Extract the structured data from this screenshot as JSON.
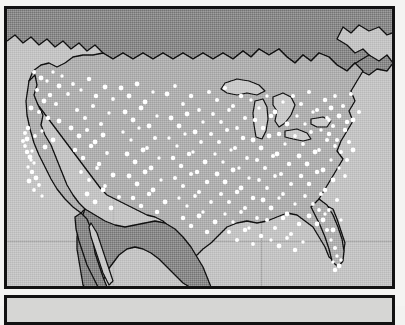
{
  "figure": {
    "title": "Dot density map of the contiguous United States",
    "background_color": "#f4f4f2",
    "border_color": "#121212",
    "panel_a_label": "map-panel",
    "panel_b_label": "secondary-panel"
  },
  "map": {
    "region": "Contiguous United States",
    "projection_note": "conic",
    "colors": {
      "ocean": "#c4c4c4",
      "united_states_land": "#b0b0b0",
      "foreign_land": "#8a8a8a",
      "lakes": "#c9c9c9",
      "dot": "#ffffff",
      "outline": "#101010",
      "graticule": "#9c9c9c"
    },
    "features": [
      {
        "name": "Canada",
        "type": "foreign-land",
        "shade": "dark-gray"
      },
      {
        "name": "Mexico",
        "type": "foreign-land",
        "shade": "dark-gray"
      },
      {
        "name": "United States",
        "type": "study-area",
        "shade": "medium-gray"
      },
      {
        "name": "Great Lakes",
        "type": "water",
        "shade": "light-gray"
      },
      {
        "name": "Pacific Ocean",
        "type": "water",
        "shade": "light-gray"
      },
      {
        "name": "Atlantic Ocean",
        "type": "water",
        "shade": "light-gray"
      },
      {
        "name": "Gulf of Mexico",
        "type": "water",
        "shade": "light-gray"
      },
      {
        "name": "Gulf of California",
        "type": "water",
        "shade": "light-gray"
      }
    ],
    "graticule": {
      "visible": true,
      "horizontal_lines": [
        238
      ],
      "vertical_lines": [
        258,
        110
      ]
    }
  },
  "chart_data": {
    "type": "scatter",
    "title": "Dot density map of the contiguous United States",
    "xlabel": "",
    "ylabel": "",
    "legend": [],
    "grid": true,
    "density_description": {
      "highest": "Northeast and Mid-Atlantic corridor",
      "high": "Great Lakes / Midwest industrial belt, Southeast Piedmont",
      "moderate": "Ohio Valley, Tennessee, Gulf Coast of Texas",
      "sparse": "Great Plains, Intermountain West",
      "coastal_clusters": "California coast, Puget Sound, Florida peninsula"
    },
    "points": [
      [
        40,
        78
      ],
      [
        46,
        81
      ],
      [
        52,
        72
      ],
      [
        58,
        86
      ],
      [
        49,
        95
      ],
      [
        36,
        90
      ],
      [
        43,
        101
      ],
      [
        55,
        104
      ],
      [
        33,
        72
      ],
      [
        61,
        76
      ],
      [
        67,
        94
      ],
      [
        38,
        112
      ],
      [
        47,
        118
      ],
      [
        30,
        108
      ],
      [
        58,
        121
      ],
      [
        27,
        128
      ],
      [
        34,
        136
      ],
      [
        41,
        131
      ],
      [
        52,
        140
      ],
      [
        44,
        147
      ],
      [
        31,
        151
      ],
      [
        26,
        139
      ],
      [
        24,
        146
      ],
      [
        29,
        157
      ],
      [
        33,
        163
      ],
      [
        27,
        167
      ],
      [
        31,
        172
      ],
      [
        35,
        178
      ],
      [
        28,
        181
      ],
      [
        38,
        185
      ],
      [
        33,
        190
      ],
      [
        41,
        196
      ],
      [
        24,
        133
      ],
      [
        22,
        141
      ],
      [
        26,
        152
      ],
      [
        30,
        160
      ],
      [
        72,
        84
      ],
      [
        80,
        90
      ],
      [
        88,
        79
      ],
      [
        95,
        96
      ],
      [
        104,
        87
      ],
      [
        112,
        99
      ],
      [
        76,
        110
      ],
      [
        84,
        118
      ],
      [
        92,
        106
      ],
      [
        100,
        124
      ],
      [
        108,
        113
      ],
      [
        70,
        128
      ],
      [
        78,
        136
      ],
      [
        86,
        130
      ],
      [
        94,
        142
      ],
      [
        102,
        135
      ],
      [
        74,
        150
      ],
      [
        82,
        158
      ],
      [
        90,
        146
      ],
      [
        98,
        164
      ],
      [
        106,
        153
      ],
      [
        80,
        172
      ],
      [
        88,
        180
      ],
      [
        96,
        168
      ],
      [
        104,
        186
      ],
      [
        112,
        175
      ],
      [
        86,
        194
      ],
      [
        94,
        202
      ],
      [
        102,
        190
      ],
      [
        110,
        208
      ],
      [
        118,
        197
      ],
      [
        120,
        88
      ],
      [
        128,
        96
      ],
      [
        136,
        84
      ],
      [
        144,
        102
      ],
      [
        152,
        92
      ],
      [
        124,
        112
      ],
      [
        132,
        120
      ],
      [
        140,
        108
      ],
      [
        148,
        126
      ],
      [
        156,
        116
      ],
      [
        122,
        132
      ],
      [
        130,
        140
      ],
      [
        138,
        128
      ],
      [
        146,
        148
      ],
      [
        154,
        138
      ],
      [
        126,
        154
      ],
      [
        134,
        162
      ],
      [
        142,
        150
      ],
      [
        150,
        168
      ],
      [
        158,
        158
      ],
      [
        128,
        176
      ],
      [
        136,
        184
      ],
      [
        144,
        172
      ],
      [
        152,
        190
      ],
      [
        160,
        180
      ],
      [
        132,
        198
      ],
      [
        140,
        206
      ],
      [
        148,
        194
      ],
      [
        156,
        212
      ],
      [
        164,
        202
      ],
      [
        166,
        94
      ],
      [
        174,
        86
      ],
      [
        182,
        104
      ],
      [
        190,
        96
      ],
      [
        198,
        110
      ],
      [
        170,
        118
      ],
      [
        178,
        126
      ],
      [
        186,
        114
      ],
      [
        194,
        132
      ],
      [
        202,
        122
      ],
      [
        168,
        138
      ],
      [
        176,
        146
      ],
      [
        184,
        134
      ],
      [
        192,
        152
      ],
      [
        200,
        142
      ],
      [
        172,
        158
      ],
      [
        180,
        166
      ],
      [
        188,
        154
      ],
      [
        196,
        172
      ],
      [
        204,
        162
      ],
      [
        174,
        178
      ],
      [
        182,
        186
      ],
      [
        190,
        174
      ],
      [
        198,
        192
      ],
      [
        206,
        182
      ],
      [
        178,
        198
      ],
      [
        186,
        206
      ],
      [
        194,
        196
      ],
      [
        202,
        212
      ],
      [
        210,
        202
      ],
      [
        182,
        218
      ],
      [
        190,
        226
      ],
      [
        198,
        216
      ],
      [
        206,
        232
      ],
      [
        214,
        222
      ],
      [
        208,
        92
      ],
      [
        216,
        100
      ],
      [
        224,
        88
      ],
      [
        232,
        106
      ],
      [
        240,
        96
      ],
      [
        212,
        114
      ],
      [
        220,
        122
      ],
      [
        228,
        110
      ],
      [
        236,
        128
      ],
      [
        244,
        118
      ],
      [
        210,
        134
      ],
      [
        218,
        142
      ],
      [
        226,
        130
      ],
      [
        234,
        148
      ],
      [
        242,
        138
      ],
      [
        214,
        154
      ],
      [
        222,
        162
      ],
      [
        230,
        150
      ],
      [
        238,
        168
      ],
      [
        246,
        158
      ],
      [
        216,
        174
      ],
      [
        224,
        182
      ],
      [
        232,
        170
      ],
      [
        240,
        188
      ],
      [
        248,
        178
      ],
      [
        220,
        194
      ],
      [
        228,
        202
      ],
      [
        236,
        192
      ],
      [
        244,
        208
      ],
      [
        252,
        198
      ],
      [
        224,
        214
      ],
      [
        232,
        222
      ],
      [
        240,
        212
      ],
      [
        248,
        228
      ],
      [
        256,
        218
      ],
      [
        228,
        232
      ],
      [
        236,
        240
      ],
      [
        244,
        230
      ],
      [
        252,
        244
      ],
      [
        260,
        236
      ],
      [
        250,
        100
      ],
      [
        258,
        108
      ],
      [
        266,
        96
      ],
      [
        274,
        112
      ],
      [
        282,
        102
      ],
      [
        254,
        120
      ],
      [
        262,
        128
      ],
      [
        270,
        116
      ],
      [
        278,
        134
      ],
      [
        286,
        124
      ],
      [
        252,
        140
      ],
      [
        260,
        148
      ],
      [
        268,
        136
      ],
      [
        276,
        154
      ],
      [
        284,
        144
      ],
      [
        256,
        160
      ],
      [
        264,
        168
      ],
      [
        272,
        156
      ],
      [
        280,
        174
      ],
      [
        288,
        164
      ],
      [
        258,
        180
      ],
      [
        266,
        188
      ],
      [
        274,
        176
      ],
      [
        282,
        194
      ],
      [
        290,
        184
      ],
      [
        262,
        200
      ],
      [
        270,
        208
      ],
      [
        278,
        198
      ],
      [
        286,
        214
      ],
      [
        294,
        204
      ],
      [
        266,
        220
      ],
      [
        274,
        228
      ],
      [
        282,
        218
      ],
      [
        290,
        234
      ],
      [
        298,
        224
      ],
      [
        270,
        240
      ],
      [
        278,
        246
      ],
      [
        286,
        238
      ],
      [
        294,
        250
      ],
      [
        302,
        242
      ],
      [
        292,
        96
      ],
      [
        300,
        104
      ],
      [
        308,
        92
      ],
      [
        316,
        110
      ],
      [
        324,
        100
      ],
      [
        296,
        116
      ],
      [
        304,
        124
      ],
      [
        312,
        112
      ],
      [
        320,
        130
      ],
      [
        328,
        120
      ],
      [
        294,
        136
      ],
      [
        302,
        144
      ],
      [
        310,
        132
      ],
      [
        318,
        150
      ],
      [
        326,
        140
      ],
      [
        298,
        156
      ],
      [
        306,
        164
      ],
      [
        314,
        152
      ],
      [
        322,
        170
      ],
      [
        330,
        160
      ],
      [
        300,
        176
      ],
      [
        308,
        184
      ],
      [
        316,
        172
      ],
      [
        324,
        190
      ],
      [
        332,
        180
      ],
      [
        304,
        196
      ],
      [
        312,
        204
      ],
      [
        320,
        194
      ],
      [
        328,
        210
      ],
      [
        336,
        200
      ],
      [
        308,
        216
      ],
      [
        316,
        224
      ],
      [
        324,
        214
      ],
      [
        332,
        230
      ],
      [
        340,
        220
      ],
      [
        334,
        96
      ],
      [
        342,
        106
      ],
      [
        350,
        94
      ],
      [
        358,
        112
      ],
      [
        346,
        122
      ],
      [
        338,
        116
      ],
      [
        344,
        130
      ],
      [
        352,
        120
      ],
      [
        336,
        140
      ],
      [
        348,
        142
      ],
      [
        340,
        152
      ],
      [
        346,
        160
      ],
      [
        352,
        150
      ],
      [
        338,
        168
      ],
      [
        344,
        176
      ],
      [
        330,
        108
      ],
      [
        326,
        118
      ],
      [
        332,
        126
      ],
      [
        328,
        134
      ],
      [
        334,
        146
      ],
      [
        318,
        210
      ],
      [
        322,
        220
      ],
      [
        326,
        230
      ],
      [
        330,
        240
      ],
      [
        334,
        248
      ],
      [
        336,
        256
      ],
      [
        332,
        262
      ],
      [
        338,
        266
      ],
      [
        334,
        270
      ],
      [
        340,
        260
      ]
    ]
  }
}
